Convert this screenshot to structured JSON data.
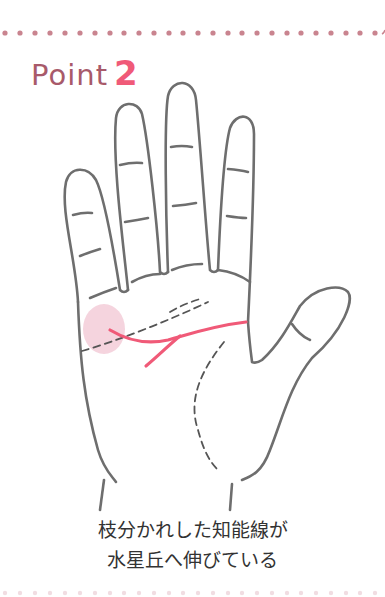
{
  "header": {
    "title_word": "Point",
    "title_number": "2"
  },
  "illustration": {
    "subject": "palm-with-lines",
    "highlighted_line": "branched-head-line",
    "highlight_region": "mount-of-mercury"
  },
  "caption": {
    "line1": "枝分かれした知能線が",
    "line2": "水星丘へ伸びている"
  },
  "colors": {
    "dots": "#c9848f",
    "title_word": "#a85a6a",
    "title_number": "#f05a78",
    "accent_line": "#f05a78",
    "highlight": "#f3cdd8",
    "outline": "#6e6e6e",
    "text": "#333333"
  }
}
